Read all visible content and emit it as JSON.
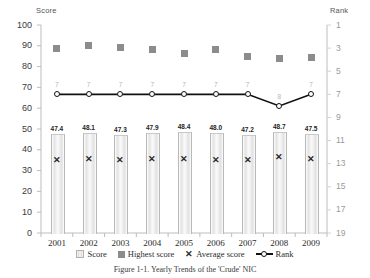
{
  "chart_data": {
    "type": "bar",
    "title": "",
    "caption": "Figure 1-1. Yearly Trends of the 'Crude' NIC",
    "categories": [
      "2001",
      "2002",
      "2003",
      "2004",
      "2005",
      "2006",
      "2007",
      "2008",
      "2009"
    ],
    "xlabel": "",
    "ylabel": "Score",
    "ylim": [
      0,
      100
    ],
    "ytick_labels": [
      "100",
      "90",
      "80",
      "70",
      "60",
      "50",
      "40",
      "30",
      "20",
      "10",
      "0"
    ],
    "y2label": "Rank",
    "y2lim": [
      1,
      19
    ],
    "y2_inverted": true,
    "y2tick_labels": [
      "1",
      "3",
      "5",
      "7",
      "9",
      "11",
      "13",
      "15",
      "17",
      "19"
    ],
    "grid": false,
    "legend_position": "bottom",
    "series": [
      {
        "name": "Score",
        "type": "bar",
        "axis": "left",
        "values": [
          47.4,
          48.1,
          47.3,
          47.9,
          48.4,
          48.0,
          47.2,
          48.7,
          47.5
        ],
        "data_labels": [
          "47.4",
          "48.1",
          "47.3",
          "47.9",
          "48.4",
          "48.0",
          "47.2",
          "48.7",
          "47.5"
        ]
      },
      {
        "name": "Highest score",
        "type": "scatter",
        "marker": "square",
        "axis": "left",
        "values": [
          88.5,
          90.0,
          89.0,
          88.0,
          86.5,
          88.0,
          85.0,
          84.0,
          84.5
        ]
      },
      {
        "name": "Average score",
        "type": "scatter",
        "marker": "x",
        "axis": "left",
        "values": [
          35.0,
          35.3,
          34.8,
          35.4,
          35.2,
          35.0,
          34.7,
          36.2,
          35.1
        ]
      },
      {
        "name": "Rank",
        "type": "line",
        "marker": "circle",
        "axis": "right",
        "values": [
          7,
          7,
          7,
          7,
          7,
          7,
          7,
          8,
          7
        ],
        "data_labels": [
          "7",
          "7",
          "7",
          "7",
          "7",
          "7",
          "7",
          "8",
          "7"
        ]
      }
    ],
    "legend": [
      {
        "label": "Score",
        "swatch": "bar-swatch"
      },
      {
        "label": "Highest score",
        "swatch": "square-marker"
      },
      {
        "label": "Average score",
        "swatch": "x-marker"
      },
      {
        "label": "Rank",
        "swatch": "line-circle-marker"
      }
    ],
    "colors": {
      "bar_fill": "#e3e3e3",
      "bar_outline": "#b8b8b8",
      "square_marker": "#8c8c8c",
      "x_marker": "#2a2a2a",
      "rank_line": "#111111",
      "axis": "#bdbdbd",
      "right_tick_text": "#9a9a9a"
    }
  }
}
